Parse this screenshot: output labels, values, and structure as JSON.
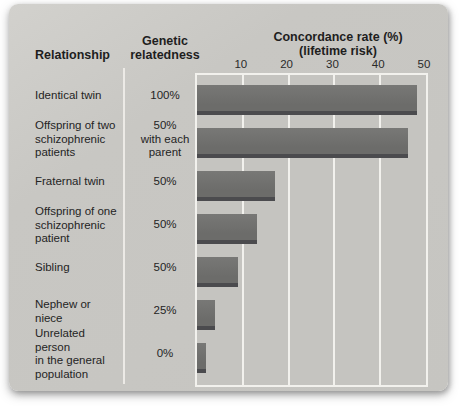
{
  "figure": {
    "headers": {
      "relationship": "Relationship",
      "genetic": "Genetic\nrelatedness",
      "concordance": "Concordance rate (%)\n(lifetime risk)"
    },
    "rows": [
      {
        "relationship": "Identical twin",
        "relatedness": "100%"
      },
      {
        "relationship": "Offspring of two\nschizophrenic\npatients",
        "relatedness": "50%\nwith each\nparent"
      },
      {
        "relationship": "Fraternal twin",
        "relatedness": "50%"
      },
      {
        "relationship": "Offspring of one\nschizophrenic\npatient",
        "relatedness": "50%"
      },
      {
        "relationship": "Sibling",
        "relatedness": "50%"
      },
      {
        "relationship": "Nephew or niece",
        "relatedness": "25%"
      },
      {
        "relationship": "Unrelated person\nin the general\npopulation",
        "relatedness": "0%"
      }
    ],
    "chart_data": {
      "type": "bar",
      "orientation": "horizontal",
      "title": "Concordance rate (%) (lifetime risk)",
      "categories": [
        "Identical twin",
        "Offspring of two schizophrenic patients",
        "Fraternal twin",
        "Offspring of one schizophrenic patient",
        "Sibling",
        "Nephew or niece",
        "Unrelated person in the general population"
      ],
      "genetic_relatedness": [
        "100%",
        "50% with each parent",
        "50%",
        "50%",
        "50%",
        "25%",
        "0%"
      ],
      "values": [
        48,
        46,
        17,
        13,
        9,
        4,
        2
      ],
      "xlim": [
        0,
        50
      ],
      "xticks": [
        10,
        20,
        30,
        40,
        50
      ],
      "grid": true,
      "legend": false,
      "bar_color": "#6c6c6a",
      "bar_shadow_color": "#4b4b4e",
      "gridline_color": "#f2f1ed",
      "panel_background": "#c7c6c2"
    }
  }
}
